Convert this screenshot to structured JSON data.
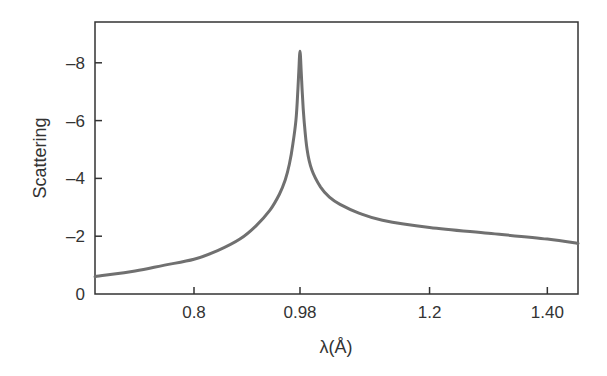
{
  "chart_data": {
    "type": "line",
    "title": "",
    "xlabel": "λ(Å)",
    "ylabel": "Scattering",
    "xlim": [
      0.632,
      1.452
    ],
    "ylim": [
      0,
      9.4
    ],
    "grid": false,
    "legend": null,
    "x_ticks": [
      {
        "value": 0.8,
        "label": "0.8"
      },
      {
        "value": 0.98,
        "label": "0.98"
      },
      {
        "value": 1.2,
        "label": "1.2"
      },
      {
        "value": 1.4,
        "label": "1.40"
      }
    ],
    "y_ticks": [
      {
        "value": 0,
        "label": "0"
      },
      {
        "value": 2,
        "label": "–2"
      },
      {
        "value": 4,
        "label": "–4"
      },
      {
        "value": 6,
        "label": "–6"
      },
      {
        "value": 8,
        "label": "–8"
      }
    ],
    "series": [
      {
        "name": "Scattering",
        "color": "#707070",
        "x": [
          0.632,
          0.7,
          0.75,
          0.8,
          0.84,
          0.878,
          0.905,
          0.929,
          0.945,
          0.955,
          0.962,
          0.968,
          0.973,
          0.976,
          0.978,
          0.98,
          0.982,
          0.984,
          0.987,
          0.992,
          1.0,
          1.015,
          1.03,
          1.048,
          1.08,
          1.12,
          1.2,
          1.3,
          1.4,
          1.452
        ],
        "values": [
          0.6,
          0.8,
          1.0,
          1.2,
          1.5,
          1.9,
          2.35,
          2.9,
          3.45,
          3.95,
          4.5,
          5.2,
          6.0,
          6.9,
          7.7,
          8.4,
          7.7,
          6.9,
          6.0,
          5.0,
          4.3,
          3.7,
          3.35,
          3.1,
          2.8,
          2.55,
          2.3,
          2.1,
          1.9,
          1.75
        ]
      }
    ]
  },
  "colors": {
    "axis": "#333333",
    "line": "#707070",
    "background": "#ffffff"
  }
}
